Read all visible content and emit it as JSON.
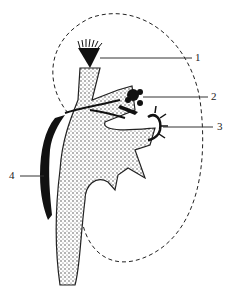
{
  "diagram": {
    "labels": [
      {
        "id": "1",
        "text": "1"
      },
      {
        "id": "2",
        "text": "2"
      },
      {
        "id": "3",
        "text": "3"
      },
      {
        "id": "4",
        "text": "4"
      }
    ],
    "colors": {
      "ink": "#111111",
      "stipple": "#444444",
      "background": "#ffffff"
    }
  }
}
